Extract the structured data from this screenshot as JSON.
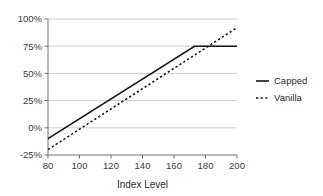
{
  "chart_data": {
    "type": "line",
    "title": "",
    "xlabel": "Index Level",
    "ylabel": "",
    "xlim": [
      80,
      200
    ],
    "ylim": [
      -25,
      100
    ],
    "grid": true,
    "legend_position": "right",
    "x_ticks": [
      "80",
      "100",
      "120",
      "140",
      "160",
      "180",
      "200"
    ],
    "x_tick_values": [
      80,
      100,
      120,
      140,
      160,
      180,
      200
    ],
    "y_ticks": [
      "-25%",
      "0%",
      "25%",
      "50%",
      "75%",
      "100%"
    ],
    "y_tick_values": [
      -25,
      0,
      25,
      50,
      75,
      100
    ],
    "series": [
      {
        "name": "Capped",
        "style": "solid",
        "color": "#141414",
        "x": [
          80,
          173,
          200
        ],
        "values": [
          -10,
          75,
          75
        ]
      },
      {
        "name": "Vanilla",
        "style": "dotted",
        "color": "#141414",
        "x": [
          80,
          200
        ],
        "values": [
          -20,
          92
        ]
      }
    ]
  },
  "legend": {
    "items": [
      {
        "label": "Capped",
        "style": "solid"
      },
      {
        "label": "Vanilla",
        "style": "dotted"
      }
    ]
  },
  "axes": {
    "x_title": "Index Level"
  },
  "colors": {
    "line": "#141414",
    "grid": "#b9b9b9",
    "axis": "#6e6e6e",
    "text": "#2b2b2b",
    "background": "#ffffff"
  }
}
